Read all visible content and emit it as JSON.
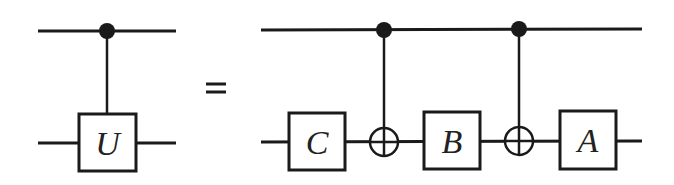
{
  "diagram": {
    "type": "quantum-circuit-identity",
    "lhs": {
      "gate": {
        "label": "U",
        "kind": "controlled-unitary",
        "control_qubit": 0,
        "target_qubit": 1
      }
    },
    "relation": "=",
    "rhs": {
      "gates": [
        {
          "label": "C",
          "kind": "single-qubit",
          "qubit": 1
        },
        {
          "label": "",
          "kind": "CNOT",
          "control_qubit": 0,
          "target_qubit": 1
        },
        {
          "label": "B",
          "kind": "single-qubit",
          "qubit": 1
        },
        {
          "label": "",
          "kind": "CNOT",
          "control_qubit": 0,
          "target_qubit": 1
        },
        {
          "label": "A",
          "kind": "single-qubit",
          "qubit": 1
        }
      ]
    },
    "colors": {
      "line": "#1a1a1a",
      "background": "#ffffff"
    }
  }
}
